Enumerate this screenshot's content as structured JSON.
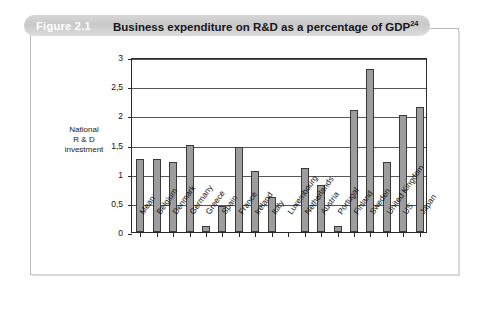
{
  "header": {
    "figure_number": "Figure 2.1",
    "title": "Business expenditure on R&D as a percentage of GDP",
    "title_superscript": "24"
  },
  "chart_data": {
    "type": "bar",
    "title": "Business expenditure on R&D as a percentage of GDP",
    "xlabel": "",
    "ylabel": "National\nR & D\ninvestment",
    "ylabel_lines": [
      "National",
      "R & D",
      "investment"
    ],
    "ylim": [
      0,
      3
    ],
    "ytick_labels": [
      "0",
      "0,5",
      "1",
      "1,5",
      "2",
      "2,5",
      "3"
    ],
    "ytick_values": [
      0,
      0.5,
      1,
      1.5,
      2,
      2.5,
      3
    ],
    "grid": true,
    "legend": false,
    "decimal_separator": ",",
    "bar_color": "#9d9d9d",
    "bar_edge_color": "#3a3a3a",
    "categories": [
      "Mean",
      "Belgium",
      "Denmark",
      "Germany",
      "Greece",
      "Spain",
      "France",
      "Ireland",
      "Italy",
      "Luxembourg",
      "Netherlands",
      "Austria",
      "Portugal",
      "Finland",
      "Sweden",
      "United Kingdom",
      "US",
      "Japan"
    ],
    "values": [
      1.25,
      1.25,
      1.2,
      1.5,
      0.1,
      0.45,
      1.45,
      1.05,
      0.6,
      0,
      1.1,
      0.8,
      0.1,
      2.1,
      2.8,
      1.2,
      2.0,
      2.15
    ]
  }
}
